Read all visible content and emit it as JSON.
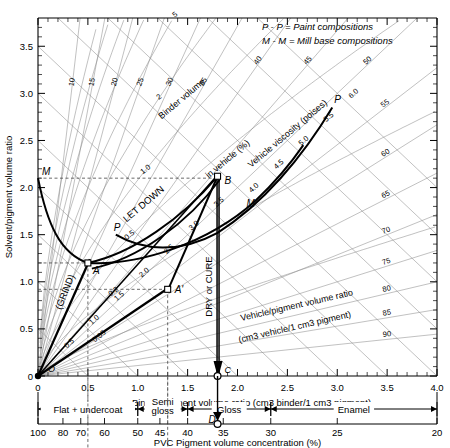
{
  "chart_data": {
    "type": "line",
    "xlabel": "Binder/pigment  volume ratio  (cm3 binder/1 cm3 pigment)",
    "ylabel": "Solvent/pigment volume ratio",
    "secondary_xlabel": "PVC Pigment volume concentration (%)",
    "xlim": [
      0,
      4.0
    ],
    "ylim": [
      0,
      3.8
    ],
    "grid": true,
    "legend_position": "top-right",
    "x_ticks": [
      "0",
      "0.5",
      "1.0",
      "1.5",
      "2.0",
      "2.5",
      "3.0",
      "3.5",
      "4.0"
    ],
    "x_tick_values": [
      0,
      0.5,
      1.0,
      1.5,
      2.0,
      2.5,
      3.0,
      3.5,
      4.0
    ],
    "y_ticks": [
      "0",
      "0.5",
      "1.0",
      "1.5",
      "2.0",
      "2.5",
      "3.0",
      "3.5"
    ],
    "y_tick_values": [
      0,
      0.5,
      1.0,
      1.5,
      2.0,
      2.5,
      3.0,
      3.5
    ],
    "pvc_ticks": [
      "100",
      "80",
      "70",
      "60",
      "50",
      "45",
      "40",
      "35",
      "30",
      "25",
      "20"
    ],
    "pvc_tick_values": [
      100,
      80,
      70,
      60,
      50,
      45,
      40,
      35,
      30,
      25,
      20
    ],
    "legend": [
      "P - P  =  Paint compositions",
      "M - M  =  Mill base compositions"
    ],
    "families": [
      {
        "name": "binder-volume-in-vehicle",
        "label": "Binder volume   in vehicle (%)",
        "values": [
          10,
          15,
          20,
          25,
          30,
          35,
          40,
          45,
          50,
          55,
          60,
          65,
          70,
          75,
          80,
          85,
          90
        ]
      },
      {
        "name": "vehicle-viscosity",
        "label": "Vehicle viscosity (poises)",
        "values": [
          "0.05",
          "0.2",
          "0.5",
          "1.0",
          "2",
          "5",
          "10",
          "20",
          "50",
          "100"
        ]
      },
      {
        "name": "vehicle-pigment-volume-ratio",
        "label": "Vehicle/pigment volume ratio",
        "sublabel": "(cm3 vehicle/1 cm3 pigment)",
        "values": [
          "0.5",
          "1.0",
          "1.5",
          "2.0",
          "2.5",
          "3.0",
          "3.5",
          "4.0",
          "4.5",
          "5.0",
          "5.5",
          "6.0"
        ]
      }
    ],
    "points": [
      {
        "id": "O",
        "label": "O",
        "x": 0.0,
        "y": 0.0
      },
      {
        "id": "M",
        "label": "M",
        "x": 0.0,
        "y": 2.1
      },
      {
        "id": "A",
        "label": "A",
        "x": 0.5,
        "y": 1.2
      },
      {
        "id": "P",
        "label": "P",
        "x": 0.78,
        "y": 1.5
      },
      {
        "id": "Ap",
        "label": "A'",
        "x": 1.3,
        "y": 0.92
      },
      {
        "id": "B",
        "label": "B",
        "x": 1.8,
        "y": 2.12
      },
      {
        "id": "Mp",
        "label": "M",
        "x": 2.18,
        "y": 1.86
      },
      {
        "id": "Pp",
        "label": "P",
        "x": 2.95,
        "y": 2.85
      },
      {
        "id": "C",
        "label": "C",
        "x": 1.8,
        "y": 0.0
      },
      {
        "id": "D",
        "label": "D",
        "x": 1.8,
        "y": 0.0
      }
    ],
    "process_labels": [
      {
        "name": "grind",
        "text": "(GRIND)"
      },
      {
        "name": "let-down",
        "text": "LET DOWN"
      },
      {
        "name": "dry-or-cure",
        "text": "DRY or CURE"
      }
    ],
    "application_bands": [
      {
        "label": "Flat + undercoat",
        "from_pvc": 100,
        "to_pvc": 50
      },
      {
        "label": "Semi gloss",
        "from_pvc": 50,
        "to_pvc": 40
      },
      {
        "label": "Gloss",
        "from_pvc": 40,
        "to_pvc": 30
      },
      {
        "label": "Enamel",
        "from_pvc": 30,
        "to_pvc": 20
      }
    ],
    "colors": {
      "ink": "#000000",
      "grid": "#8d8d8d",
      "curve": "#000000",
      "paper": "#ffffff"
    }
  }
}
